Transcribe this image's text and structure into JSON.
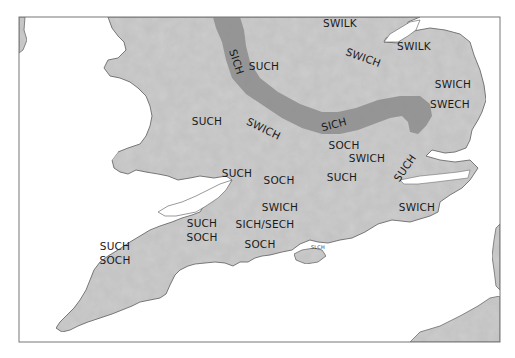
{
  "map": {
    "title": "",
    "colors": {
      "sea": "#ffffff",
      "land": "#cdcdcd",
      "land_stroke": "#6e6e6e",
      "sich_band": "#8f8f8f",
      "frame": "#777777",
      "label": "#1a1a1a"
    },
    "labels": [
      {
        "id": "swilk-north",
        "text": "SWILK",
        "x": 340,
        "y": 27,
        "rotate": 0
      },
      {
        "id": "swilk-east",
        "text": "SWILK",
        "x": 414,
        "y": 50,
        "rotate": 0
      },
      {
        "id": "swich-lincs",
        "text": "SWICH",
        "x": 362,
        "y": 61,
        "rotate": 20
      },
      {
        "id": "such-midlands",
        "text": "SUCH",
        "x": 264,
        "y": 70,
        "rotate": 0
      },
      {
        "id": "sich-band-north",
        "text": "SICH",
        "x": 233,
        "y": 63,
        "rotate": 72
      },
      {
        "id": "swich-norfolk",
        "text": "SWICH",
        "x": 453,
        "y": 88,
        "rotate": 0
      },
      {
        "id": "swech-norfolk",
        "text": "SWECH",
        "x": 450,
        "y": 108,
        "rotate": 0
      },
      {
        "id": "such-wales-border",
        "text": "SUCH",
        "x": 207,
        "y": 125,
        "rotate": 0
      },
      {
        "id": "swich-central",
        "text": "SWICH",
        "x": 262,
        "y": 132,
        "rotate": 26
      },
      {
        "id": "sich-band-east",
        "text": "SICH",
        "x": 335,
        "y": 128,
        "rotate": -15
      },
      {
        "id": "soch-essex-west",
        "text": "SOCH",
        "x": 344,
        "y": 149,
        "rotate": 0
      },
      {
        "id": "swich-essex",
        "text": "SWICH",
        "x": 367,
        "y": 162,
        "rotate": 0
      },
      {
        "id": "such-thames",
        "text": "SUCH",
        "x": 408,
        "y": 170,
        "rotate": -55
      },
      {
        "id": "such-glos",
        "text": "SUCH",
        "x": 237,
        "y": 177,
        "rotate": 0
      },
      {
        "id": "soch-oxon",
        "text": "SOCH",
        "x": 279,
        "y": 184,
        "rotate": 0
      },
      {
        "id": "such-london",
        "text": "SUCH",
        "x": 342,
        "y": 181,
        "rotate": 0
      },
      {
        "id": "swich-wilts",
        "text": "SWICH",
        "x": 280,
        "y": 211,
        "rotate": 0
      },
      {
        "id": "swich-kent",
        "text": "SWICH",
        "x": 417,
        "y": 211,
        "rotate": 0
      },
      {
        "id": "such-somerset",
        "text": "SUCH",
        "x": 202,
        "y": 227,
        "rotate": 0
      },
      {
        "id": "sich-sech-hants",
        "text": "SICH/SECH",
        "x": 265,
        "y": 228,
        "rotate": 0
      },
      {
        "id": "soch-somerset",
        "text": "SOCH",
        "x": 202,
        "y": 241,
        "rotate": 0
      },
      {
        "id": "soch-dorset",
        "text": "SOCH",
        "x": 260,
        "y": 248,
        "rotate": 0
      },
      {
        "id": "such-devon",
        "text": "SUCH",
        "x": 115,
        "y": 250,
        "rotate": 0
      },
      {
        "id": "soch-devon",
        "text": "SOCH",
        "x": 115,
        "y": 264,
        "rotate": 0
      }
    ],
    "minor_labels": [
      {
        "id": "solent-label",
        "text": "SLCH",
        "x": 318,
        "y": 249
      }
    ]
  }
}
